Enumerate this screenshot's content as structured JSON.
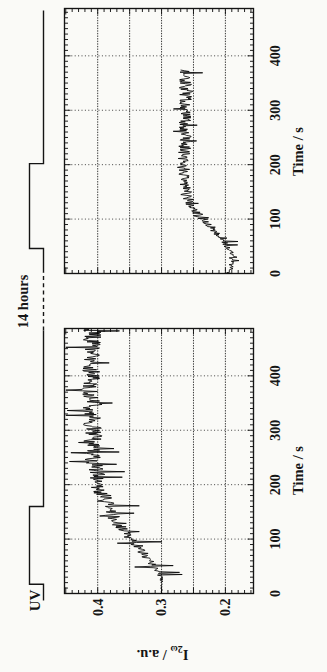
{
  "page": {
    "paper_color": "#fafaf7",
    "ink_color": "#141414"
  },
  "uv": {
    "label": "UV",
    "pause_label": "14 hours"
  },
  "chart_data": [
    {
      "type": "line",
      "title": "",
      "xlabel": "Time / s",
      "ylabel": "I_2ω / a.u.",
      "ylabel_parts": {
        "prefix": "I",
        "sub": "2ω",
        "suffix": " / a.u."
      },
      "xlim": [
        0,
        487
      ],
      "ylim": [
        0.156,
        0.452
      ],
      "x_ticks": [
        0,
        100,
        200,
        300,
        400
      ],
      "x_minor_step": 10,
      "y_ticks": [
        0.4,
        0.3,
        0.2
      ],
      "y_tick_labels": [
        "0.4",
        "0.3",
        "0.2"
      ],
      "y_gridlines": [
        0.2,
        0.25,
        0.3,
        0.35,
        0.4
      ],
      "y_minor_step": 0.01,
      "grid": true,
      "legend": "none",
      "uv_pulse_s": {
        "on": 17,
        "off": 160
      },
      "series": [
        {
          "name": "SHG intensity during first UV exposure",
          "t": [
            0,
            10,
            20,
            28,
            40,
            60,
            80,
            100,
            120,
            140,
            160,
            180,
            200,
            220,
            250,
            280,
            320,
            360,
            400,
            450,
            487
          ],
          "v": [
            0.3,
            0.3,
            0.3,
            0.301,
            0.307,
            0.318,
            0.332,
            0.348,
            0.362,
            0.374,
            0.384,
            0.392,
            0.398,
            0.402,
            0.405,
            0.407,
            0.409,
            0.41,
            0.411,
            0.41,
            0.408
          ],
          "noise_t": [
            0,
            20,
            30,
            60,
            100,
            150,
            200,
            487
          ],
          "noise_a": [
            0.0015,
            0.002,
            0.004,
            0.007,
            0.01,
            0.013,
            0.014,
            0.014
          ],
          "spike_prob": 0.09,
          "spike_amp": 0.032,
          "t_end": 487
        }
      ]
    },
    {
      "type": "line",
      "title": "",
      "xlabel": "Time / s",
      "ylabel": "",
      "xlim": [
        0,
        487
      ],
      "ylim": [
        0.156,
        0.452
      ],
      "x_ticks": [
        0,
        100,
        200,
        300,
        400
      ],
      "x_minor_step": 10,
      "y_ticks": [],
      "y_tick_labels": [],
      "y_gridlines": [
        0.2,
        0.25,
        0.3,
        0.35,
        0.4
      ],
      "y_minor_step": 0.01,
      "grid": true,
      "legend": "none",
      "uv_pulse_s": {
        "on": 46,
        "off": 202
      },
      "series": [
        {
          "name": "SHG intensity after 14 hours",
          "t": [
            0,
            10,
            20,
            30,
            46,
            60,
            80,
            100,
            120,
            140,
            160,
            180,
            200,
            230,
            260,
            300,
            340,
            374
          ],
          "v": [
            0.195,
            0.191,
            0.192,
            0.19,
            0.194,
            0.203,
            0.218,
            0.235,
            0.25,
            0.26,
            0.264,
            0.266,
            0.266,
            0.264,
            0.263,
            0.262,
            0.263,
            0.261
          ],
          "noise_t": [
            0,
            40,
            60,
            120,
            200,
            374
          ],
          "noise_a": [
            0.006,
            0.005,
            0.007,
            0.009,
            0.01,
            0.01
          ],
          "spike_prob": 0.06,
          "spike_amp": 0.016,
          "t_end": 374
        }
      ]
    }
  ]
}
